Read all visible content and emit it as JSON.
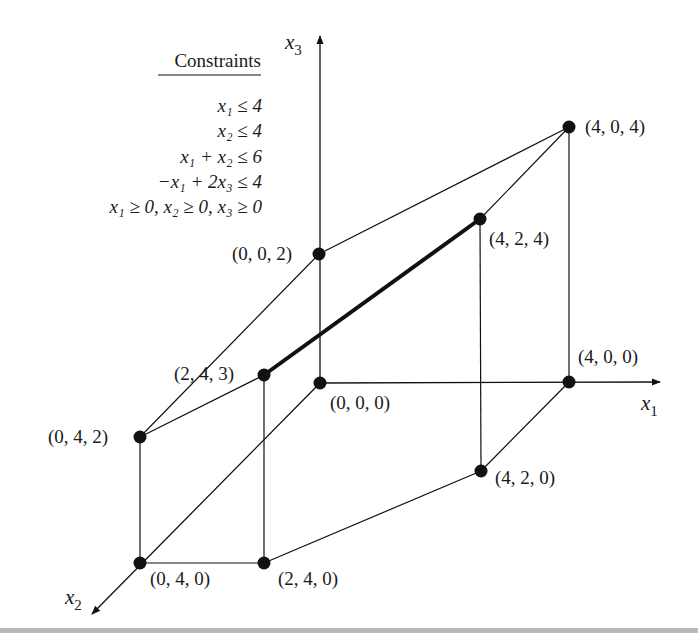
{
  "diagram": {
    "constraints_box": {
      "heading": "Constraints",
      "lines": [
        "x₁ ≤ 4",
        "x₂ ≤ 4",
        "x₁ + x₂ ≤ 6",
        "−x₁ + 2x₃ ≤ 4",
        "x₁ ≥ 0,  x₂ ≥ 0,  x₃ ≥ 0"
      ]
    },
    "axes": {
      "x1": {
        "label_base": "x",
        "label_sub": "1"
      },
      "x2": {
        "label_base": "x",
        "label_sub": "2"
      },
      "x3": {
        "label_base": "x",
        "label_sub": "3"
      }
    },
    "vertices": [
      {
        "id": "v000",
        "label": "(0, 0, 0)",
        "px": [
          320,
          383
        ]
      },
      {
        "id": "v400",
        "label": "(4, 0, 0)",
        "px": [
          569,
          382
        ]
      },
      {
        "id": "v420",
        "label": "(4, 2, 0)",
        "px": [
          481,
          471
        ]
      },
      {
        "id": "v240",
        "label": "(2, 4, 0)",
        "px": [
          264,
          563
        ]
      },
      {
        "id": "v040",
        "label": "(0, 4, 0)",
        "px": [
          140,
          563
        ]
      },
      {
        "id": "v002",
        "label": "(0, 0, 2)",
        "px": [
          319,
          254
        ]
      },
      {
        "id": "v404",
        "label": "(4, 0, 4)",
        "px": [
          569,
          127
        ]
      },
      {
        "id": "v424",
        "label": "(4, 2, 4)",
        "px": [
          480,
          219
        ]
      },
      {
        "id": "v243",
        "label": "(2, 4, 3)",
        "px": [
          264,
          375
        ]
      },
      {
        "id": "v042",
        "label": "(0, 4, 2)",
        "px": [
          140,
          437
        ]
      }
    ],
    "highlighted_edge": {
      "from": "(2, 4, 3)",
      "to": "(4, 2, 4)"
    },
    "colors": {
      "ink": "#111111",
      "background": "#ffffff",
      "bottom_rule": "#b9b9b9"
    }
  }
}
